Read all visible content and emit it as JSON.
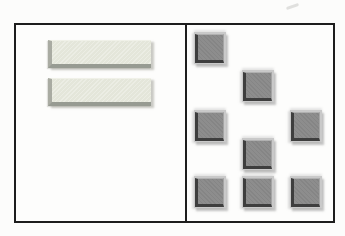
{
  "figure": {
    "background": "#fcfcfb",
    "frame": {
      "x": 14,
      "y": 23,
      "width": 321,
      "height": 200,
      "border_color": "#1d1d1d"
    },
    "divider_x": 185,
    "artifact": {
      "x": 286,
      "y": 5,
      "width": 13,
      "height": 3,
      "color": "#c9c9c6"
    },
    "left_panel": {
      "description": "panel with two horizontal beveled bars",
      "bar_colors": {
        "fill": "#e4e6da",
        "bevel_dark": "#979b92",
        "bevel_side": "#a9aba2",
        "highlight": "#f0f1e8",
        "shadow": "#c8c8c2"
      },
      "bars": [
        {
          "x": 48,
          "y": 40,
          "width": 103,
          "height": 28
        },
        {
          "x": 48,
          "y": 78,
          "width": 103,
          "height": 28
        }
      ]
    },
    "right_panel": {
      "description": "panel with eight scattered beveled square tiles",
      "tile_size": 32,
      "tile_colors": {
        "plate": "#c9c9c9",
        "fill": "#8d8d8d",
        "bevel_dark": "#3e3e3e",
        "shadow": "#d9d9d9"
      },
      "tiles": [
        {
          "x": 194,
          "y": 32
        },
        {
          "x": 242,
          "y": 70
        },
        {
          "x": 194,
          "y": 110
        },
        {
          "x": 290,
          "y": 110
        },
        {
          "x": 242,
          "y": 138
        },
        {
          "x": 194,
          "y": 176
        },
        {
          "x": 242,
          "y": 176
        },
        {
          "x": 290,
          "y": 176
        }
      ]
    }
  }
}
